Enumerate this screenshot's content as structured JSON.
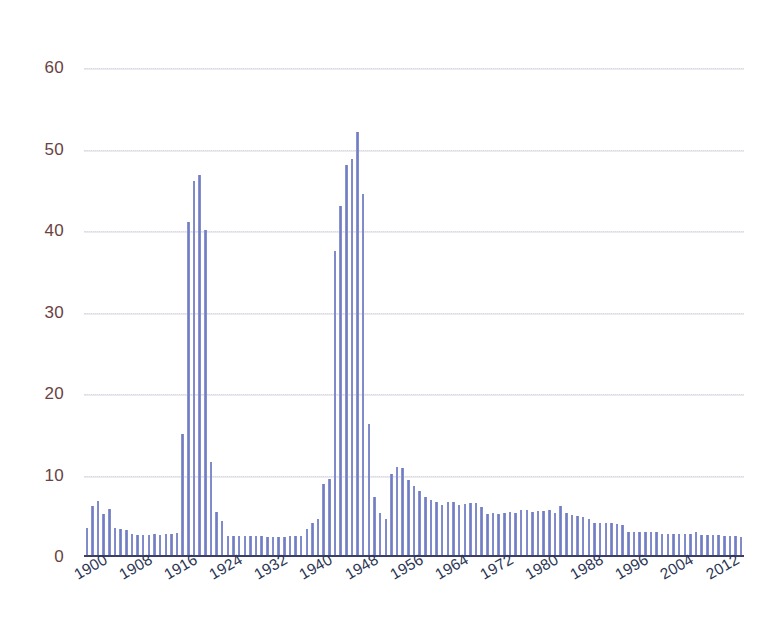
{
  "chart_data": {
    "type": "bar",
    "title": "",
    "subtitle": "",
    "xlabel": "",
    "ylabel": "",
    "xlim": [
      1899.5,
      2016.5
    ],
    "ylim": [
      0,
      62
    ],
    "grid": true,
    "legend": null,
    "legend_position": "none",
    "bar_color": "#7b86c9",
    "axis_label_color": "#6a4242",
    "tick_label_color": "#2b3554",
    "gridline_color": "#e0e0ea",
    "axis_line_color": "#3a3f63",
    "y_ticks": [
      0,
      10,
      20,
      30,
      40,
      50,
      60
    ],
    "y_tick_labels": [
      "0",
      "10",
      "20",
      "30",
      "40",
      "50",
      "60"
    ],
    "x_ticks": [
      1900,
      1908,
      1916,
      1924,
      1932,
      1940,
      1948,
      1956,
      1964,
      1972,
      1980,
      1988,
      1996,
      2004,
      2012
    ],
    "x_tick_labels": [
      "1900",
      "1908",
      "1916",
      "1924",
      "1932",
      "1940",
      "1948",
      "1956",
      "1964",
      "1972",
      "1980",
      "1988",
      "1996",
      "2004",
      "2012"
    ],
    "x_tick_rotation": -30,
    "categories": [
      1900,
      1901,
      1902,
      1903,
      1904,
      1905,
      1906,
      1907,
      1908,
      1909,
      1910,
      1911,
      1912,
      1913,
      1914,
      1915,
      1916,
      1917,
      1918,
      1919,
      1920,
      1921,
      1922,
      1923,
      1924,
      1925,
      1926,
      1927,
      1928,
      1929,
      1930,
      1931,
      1932,
      1933,
      1934,
      1935,
      1936,
      1937,
      1938,
      1939,
      1940,
      1941,
      1942,
      1943,
      1944,
      1945,
      1946,
      1947,
      1948,
      1949,
      1950,
      1951,
      1952,
      1953,
      1954,
      1955,
      1956,
      1957,
      1958,
      1959,
      1960,
      1961,
      1962,
      1963,
      1964,
      1965,
      1966,
      1967,
      1968,
      1969,
      1970,
      1971,
      1972,
      1973,
      1974,
      1975,
      1976,
      1977,
      1978,
      1979,
      1980,
      1981,
      1982,
      1983,
      1984,
      1985,
      1986,
      1987,
      1988,
      1989,
      1990,
      1991,
      1992,
      1993,
      1994,
      1995,
      1996,
      1997,
      1998,
      1999,
      2000,
      2001,
      2002,
      2003,
      2004,
      2005,
      2006,
      2007,
      2008,
      2009,
      2010,
      2011,
      2012,
      2013,
      2014,
      2015,
      2016
    ],
    "values": [
      3.5,
      6.2,
      6.8,
      5.2,
      5.8,
      3.4,
      3.3,
      3.2,
      2.7,
      2.6,
      2.6,
      2.6,
      2.7,
      2.6,
      2.7,
      2.7,
      2.8,
      15.0,
      41.0,
      46.0,
      46.8,
      40.0,
      11.5,
      5.4,
      4.3,
      2.5,
      2.5,
      2.5,
      2.4,
      2.4,
      2.4,
      2.4,
      2.3,
      2.3,
      2.3,
      2.3,
      2.4,
      2.4,
      2.5,
      3.3,
      4.0,
      4.6,
      8.9,
      9.5,
      37.5,
      43.0,
      48.0,
      48.8,
      52.0,
      44.5,
      16.2,
      7.2,
      5.3,
      4.6,
      10.1,
      10.9,
      10.8,
      9.3,
      8.6,
      8.0,
      7.2,
      6.9,
      6.6,
      6.3,
      6.6,
      6.6,
      6.3,
      6.4,
      6.5,
      6.5,
      6.0,
      5.2,
      5.3,
      5.2,
      5.3,
      5.4,
      5.3,
      5.6,
      5.7,
      5.4,
      5.5,
      5.5,
      5.6,
      5.3,
      6.2,
      5.3,
      5.0,
      4.9,
      4.8,
      4.5,
      4.0,
      4.1,
      4.1,
      4.0,
      3.9,
      3.8,
      3.0,
      3.0,
      3.0,
      3.0,
      2.9,
      2.9,
      2.7,
      2.7,
      2.7,
      2.7,
      2.7,
      2.7,
      3.0,
      2.6,
      2.6,
      2.6,
      2.6,
      2.5,
      2.5,
      2.5,
      2.3
    ]
  }
}
